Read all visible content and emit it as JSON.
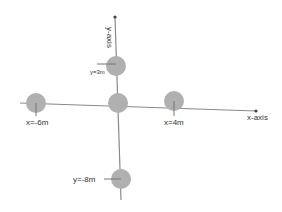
{
  "diagram": {
    "axes": {
      "x_label": "x-axis",
      "y_label": "y-axis",
      "color": "#8a8a8a"
    },
    "masses": [
      {
        "id": "origin",
        "label": "",
        "color": "#b0b0b0"
      },
      {
        "id": "top",
        "label": "y=3m",
        "color": "#b0b0b0"
      },
      {
        "id": "left",
        "label": "x=-6m",
        "color": "#b0b0b0"
      },
      {
        "id": "right",
        "label": "x=4m",
        "color": "#b0b0b0"
      },
      {
        "id": "bottom",
        "label": "y=-8m",
        "color": "#b0b0b0"
      }
    ]
  }
}
